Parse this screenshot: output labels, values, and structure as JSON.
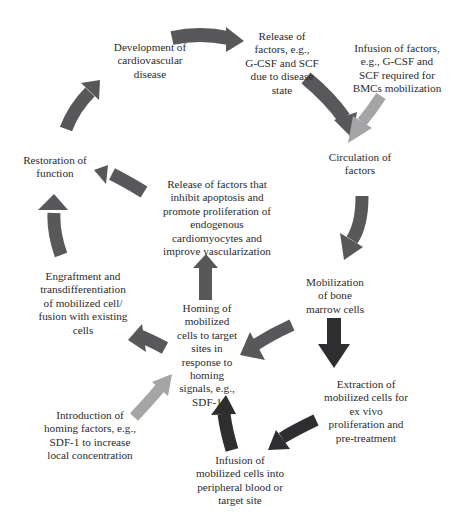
{
  "diagram": {
    "type": "cycle-flow",
    "colors": {
      "main_arrow": "#58585a",
      "dark_arrow": "#2e2e30",
      "light_arrow": "#a5a5a7",
      "text": "#2b2b2b",
      "background": "#ffffff"
    },
    "nodes": {
      "development": {
        "lines": [
          "Development of",
          "cardiovascular",
          "disease"
        ]
      },
      "release_disease": {
        "lines": [
          "Release of",
          "factors, e.g.,",
          "G-CSF and SCF",
          "due to disease",
          "state"
        ]
      },
      "infusion_factors": {
        "lines": [
          "Infusion of factors,",
          "e.g., G-CSF and",
          "SCF required for",
          "BMCs mobilization"
        ]
      },
      "circulation": {
        "lines": [
          "Circulation of",
          "factors"
        ]
      },
      "mobilization": {
        "lines": [
          "Mobilization",
          "of bone",
          "marrow cells"
        ]
      },
      "extraction": {
        "lines": [
          "Extraction of",
          "mobilized cells for",
          "ex vivo",
          "proliferation and",
          "pre-treatment"
        ]
      },
      "infusion_cells": {
        "lines": [
          "Infusion of",
          "mobilized cells into",
          "peripheral blood or",
          "target site"
        ]
      },
      "introduction_homing": {
        "lines": [
          "Introduction of",
          "homing factors, e.g.,",
          "SDF-1 to increase",
          "local concentration"
        ]
      },
      "homing": {
        "lines": [
          "Homing of",
          "mobilized",
          "cells to target",
          "sites in",
          "response to",
          "homing",
          "signals, e.g.,",
          "SDF-1"
        ]
      },
      "release_inhibit": {
        "lines": [
          "Release of factors that",
          "inhibit apoptosis and",
          "promote proliferation of",
          "endogenous",
          "cardiomyocytes and",
          "improve vascularization"
        ]
      },
      "engraftment": {
        "lines": [
          "Engraftment and",
          "transdifferentiation",
          "of mobilized cell/",
          "fusion with existing",
          "cells"
        ]
      },
      "restoration": {
        "lines": [
          "Restoration of",
          "function"
        ]
      }
    },
    "edges": [
      {
        "from": "development",
        "to": "release_disease",
        "style": "main"
      },
      {
        "from": "release_disease",
        "to": "circulation",
        "style": "main"
      },
      {
        "from": "infusion_factors",
        "to": "circulation",
        "style": "light"
      },
      {
        "from": "circulation",
        "to": "mobilization",
        "style": "main"
      },
      {
        "from": "mobilization",
        "to": "homing",
        "style": "main"
      },
      {
        "from": "mobilization",
        "to": "extraction",
        "style": "dark"
      },
      {
        "from": "extraction",
        "to": "infusion_cells",
        "style": "dark"
      },
      {
        "from": "infusion_cells",
        "to": "homing",
        "style": "dark"
      },
      {
        "from": "introduction_homing",
        "to": "homing",
        "style": "light"
      },
      {
        "from": "homing",
        "to": "release_inhibit",
        "style": "main"
      },
      {
        "from": "homing",
        "to": "engraftment",
        "style": "main"
      },
      {
        "from": "release_inhibit",
        "to": "restoration",
        "style": "main"
      },
      {
        "from": "engraftment",
        "to": "restoration",
        "style": "main"
      },
      {
        "from": "restoration",
        "to": "development",
        "style": "main"
      }
    ]
  }
}
